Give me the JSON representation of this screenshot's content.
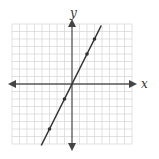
{
  "chart_data": {
    "type": "line",
    "title": "",
    "xlabel": "x",
    "ylabel": "y",
    "xlim": [
      -8,
      8
    ],
    "ylim": [
      -8,
      8
    ],
    "grid": true,
    "equation": "y = 2x",
    "series": [
      {
        "name": "line",
        "x": [
          -3,
          -1,
          0,
          2,
          3
        ],
        "y": [
          -6,
          -2,
          0,
          4,
          6
        ],
        "marked_points": [
          [
            -3,
            -6
          ],
          [
            -1,
            -2
          ],
          [
            2,
            4
          ],
          [
            3,
            6
          ]
        ]
      }
    ]
  },
  "axes": {
    "x_label": "x",
    "y_label": "y"
  },
  "colors": {
    "grid": "#d9d9d9",
    "axis": "#555555",
    "line": "#333333"
  }
}
